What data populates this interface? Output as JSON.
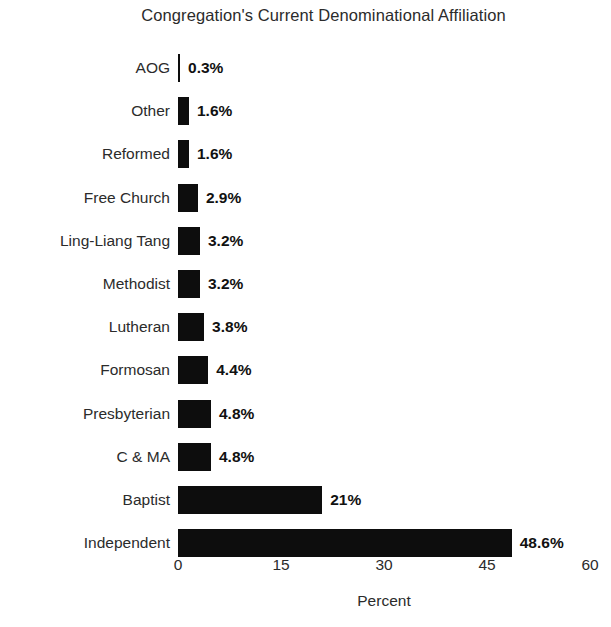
{
  "chart_data": {
    "type": "bar",
    "orientation": "horizontal",
    "title": "Congregation's Current Denominational Affiliation",
    "xlabel": "Percent",
    "ylabel": "Denominations",
    "categories": [
      "AOG",
      "Other",
      "Reformed",
      "Free Church",
      "Ling-Liang Tang",
      "Methodist",
      "Lutheran",
      "Formosan",
      "Presbyterian",
      "C & MA",
      "Baptist",
      "Independent"
    ],
    "values": [
      0.3,
      1.6,
      1.6,
      2.9,
      3.2,
      3.2,
      3.8,
      4.4,
      4.8,
      4.8,
      21,
      48.6
    ],
    "value_labels": [
      "0.3%",
      "1.6%",
      "1.6%",
      "2.9%",
      "3.2%",
      "3.2%",
      "3.8%",
      "4.4%",
      "4.8%",
      "4.8%",
      "21%",
      "48.6%"
    ],
    "xlim": [
      0,
      60
    ],
    "xticks": [
      0,
      15,
      30,
      45,
      60
    ],
    "xtick_labels": [
      "0",
      "15",
      "30",
      "45",
      "60"
    ],
    "grid": false,
    "legend": false,
    "bar_color": "#0d0d0d",
    "background_color": "#ffffff",
    "text_color": "#2b2b2b"
  }
}
